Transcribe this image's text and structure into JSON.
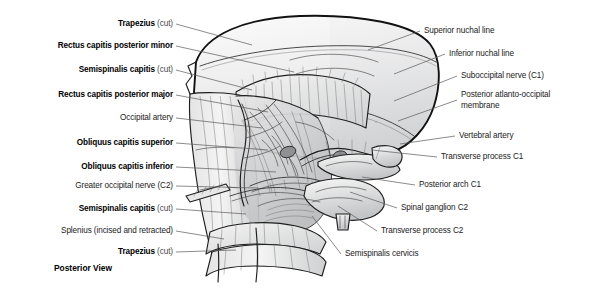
{
  "figure": {
    "caption": "Posterior View",
    "background": "#ffffff",
    "leader_color": "#5a5a5a",
    "text_color": "#1a1a1a",
    "qualifier_color": "#4a4a4a"
  },
  "labels_left": [
    {
      "id": "trapezius-cut-top",
      "text": "Trapezius",
      "qualifier": "(cut)",
      "bold": true,
      "x": 173,
      "y": 24,
      "tip_x": 252,
      "tip_y": 45
    },
    {
      "id": "rectus-capitis-posterior-minor",
      "text": "Rectus capitis posterior minor",
      "qualifier": "",
      "bold": true,
      "x": 173,
      "y": 46,
      "tip_x": 294,
      "tip_y": 72
    },
    {
      "id": "semispinalis-capitis-cut-upper",
      "text": "Semispinalis capitis",
      "qualifier": "(cut)",
      "bold": true,
      "x": 173,
      "y": 70,
      "tip_x": 252,
      "tip_y": 90
    },
    {
      "id": "rectus-capitis-posterior-major",
      "text": "Rectus capitis posterior major",
      "qualifier": "",
      "bold": true,
      "x": 173,
      "y": 95,
      "tip_x": 268,
      "tip_y": 112
    },
    {
      "id": "occipital-artery",
      "text": "Occipital artery",
      "qualifier": "",
      "bold": false,
      "x": 173,
      "y": 118,
      "tip_x": 262,
      "tip_y": 128
    },
    {
      "id": "obliquus-capitis-superior",
      "text": "Obliquus capitis superior",
      "qualifier": "",
      "bold": true,
      "x": 173,
      "y": 143,
      "tip_x": 268,
      "tip_y": 150
    },
    {
      "id": "obliquus-capitis-inferior",
      "text": "Obliquus capitis inferior",
      "qualifier": "",
      "bold": true,
      "x": 173,
      "y": 167,
      "tip_x": 276,
      "tip_y": 172
    },
    {
      "id": "greater-occipital-nerve-c2",
      "text": "Greater occipital nerve (C2)",
      "qualifier": "",
      "bold": false,
      "x": 173,
      "y": 186,
      "tip_x": 258,
      "tip_y": 188
    },
    {
      "id": "semispinalis-capitis-cut-lower",
      "text": "Semispinalis capitis",
      "qualifier": "(cut)",
      "bold": true,
      "x": 173,
      "y": 209,
      "tip_x": 246,
      "tip_y": 214
    },
    {
      "id": "splenius-incised-retracted",
      "text": "Splenius (incised and retracted)",
      "qualifier": "",
      "bold": false,
      "x": 173,
      "y": 231,
      "tip_x": 224,
      "tip_y": 239
    },
    {
      "id": "trapezius-cut-bottom",
      "text": "Trapezius",
      "qualifier": "(cut)",
      "bold": true,
      "x": 173,
      "y": 252,
      "tip_x": 236,
      "tip_y": 250
    }
  ],
  "labels_right": [
    {
      "id": "superior-nuchal-line",
      "text": "Superior nuchal line",
      "bold": false,
      "x": 424,
      "y": 31,
      "tip_x": 368,
      "tip_y": 50,
      "wrap": false
    },
    {
      "id": "inferior-nuchal-line",
      "text": "Inferior nuchal line",
      "bold": false,
      "x": 449,
      "y": 54,
      "tip_x": 394,
      "tip_y": 74,
      "wrap": false
    },
    {
      "id": "suboccipital-nerve-c1",
      "text": "Suboccipital nerve (C1)",
      "bold": false,
      "x": 461,
      "y": 76,
      "tip_x": 394,
      "tip_y": 101,
      "wrap": false
    },
    {
      "id": "posterior-atlanto-occipital-membrane",
      "text": "Posterior atlanto-occipital membrane",
      "bold": false,
      "x": 461,
      "y": 100,
      "tip_x": 398,
      "tip_y": 121,
      "wrap": true
    },
    {
      "id": "vertebral-artery",
      "text": "Vertebral artery",
      "bold": false,
      "x": 459,
      "y": 136,
      "tip_x": 400,
      "tip_y": 144,
      "wrap": false
    },
    {
      "id": "transverse-process-c1",
      "text": "Transverse process C1",
      "bold": false,
      "x": 441,
      "y": 157,
      "tip_x": 372,
      "tip_y": 150,
      "wrap": false
    },
    {
      "id": "posterior-arch-c1",
      "text": "Posterior arch C1",
      "bold": false,
      "x": 419,
      "y": 185,
      "tip_x": 362,
      "tip_y": 177,
      "wrap": false
    },
    {
      "id": "spinal-ganglion-c2",
      "text": "Spinal ganglion C2",
      "bold": false,
      "x": 401,
      "y": 208,
      "tip_x": 350,
      "tip_y": 192,
      "wrap": false
    },
    {
      "id": "transverse-process-c2",
      "text": "Transverse process C2",
      "bold": false,
      "x": 381,
      "y": 231,
      "tip_x": 338,
      "tip_y": 206,
      "wrap": false
    },
    {
      "id": "semispinalis-cervicis",
      "text": "Semispinalis cervicis",
      "bold": false,
      "x": 345,
      "y": 254,
      "tip_x": 312,
      "tip_y": 216,
      "wrap": false
    }
  ]
}
